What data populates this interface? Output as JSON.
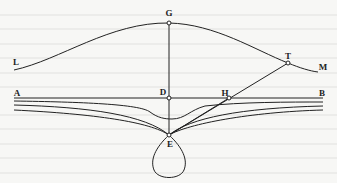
{
  "figure": {
    "colors": {
      "background": "#f7f7f5",
      "ink": "#222222",
      "point_fill": "#ffffff"
    },
    "points": {
      "G": {
        "label": "G",
        "x": 169,
        "y": 23,
        "label_x": 169,
        "label_y": 13
      },
      "D": {
        "label": "D",
        "x": 169,
        "y": 98,
        "label_x": 163,
        "label_y": 92
      },
      "E": {
        "label": "E",
        "x": 169,
        "y": 135,
        "label_x": 170,
        "label_y": 144
      },
      "H": {
        "label": "H",
        "x": 229,
        "y": 98,
        "label_x": 225,
        "label_y": 93
      },
      "T": {
        "label": "T",
        "x": 288,
        "y": 63,
        "label_x": 288,
        "label_y": 56
      },
      "L": {
        "label": "L",
        "label_x": 16,
        "label_y": 62
      },
      "M": {
        "label": "M",
        "label_x": 323,
        "label_y": 67
      },
      "A": {
        "label": "A",
        "label_x": 17,
        "label_y": 93
      },
      "B": {
        "label": "B",
        "label_x": 322,
        "label_y": 93
      }
    }
  }
}
